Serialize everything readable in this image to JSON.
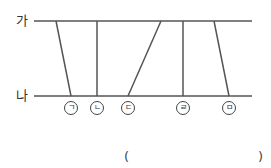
{
  "lines": {
    "top_label": "가",
    "bottom_label": "나"
  },
  "segments": [
    {
      "label": "ㄱ",
      "top_x": 56,
      "bottom_x": 71
    },
    {
      "label": "ㄴ",
      "top_x": 97,
      "bottom_x": 97
    },
    {
      "label": "ㄷ",
      "top_x": 161,
      "bottom_x": 128
    },
    {
      "label": "ㄹ",
      "top_x": 183,
      "bottom_x": 183
    },
    {
      "label": "ㅁ",
      "top_x": 214,
      "bottom_x": 229
    }
  ],
  "answer": {
    "open": "(",
    "close": ")",
    "value": ""
  },
  "colors": {
    "line": "#555555"
  }
}
